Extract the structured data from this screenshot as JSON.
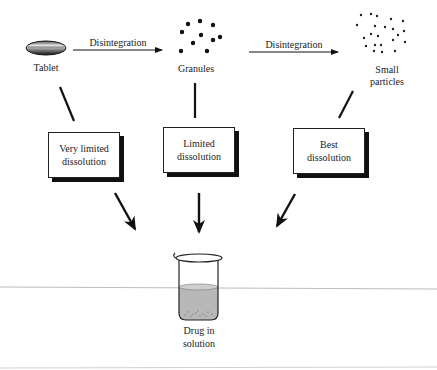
{
  "diagram": {
    "stages": [
      {
        "id": "tablet",
        "label": "Tablet"
      },
      {
        "id": "granules",
        "label": "Granules"
      },
      {
        "id": "small_particles",
        "label_line1": "Small",
        "label_line2": "particles"
      }
    ],
    "transitions": [
      {
        "from": "tablet",
        "to": "granules",
        "label": "Disintegration"
      },
      {
        "from": "granules",
        "to": "small_particles",
        "label": "Disintegration"
      }
    ],
    "outcomes": [
      {
        "from": "tablet",
        "line1": "Very limited",
        "line2": "dissolution"
      },
      {
        "from": "granules",
        "line1": "Limited",
        "line2": "dissolution"
      },
      {
        "from": "small_particles",
        "line1": "Best",
        "line2": "dissolution"
      }
    ],
    "result": {
      "line1": "Drug in",
      "line2": "solution"
    },
    "colors": {
      "ink": "#111111",
      "liquid": "#b8b8b8",
      "background": "#ffffff"
    }
  }
}
